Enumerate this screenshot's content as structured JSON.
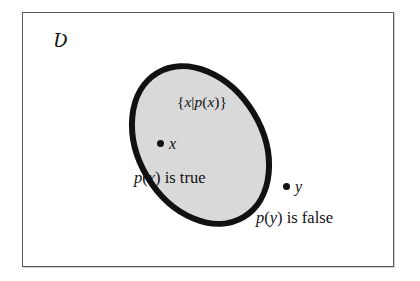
{
  "figure": {
    "type": "set-diagram"
  },
  "universe": {
    "symbol": "Ʋ",
    "name": "universal-set",
    "frame_color": "#59595c",
    "background_color": "#ffffff"
  },
  "set": {
    "name": "truth-set",
    "label": "{x|p(x)}",
    "label_parts": {
      "open_brace": "{",
      "var_x": "x",
      "bar": "|",
      "pred_p": "p",
      "open_paren": "(",
      "arg_x": "x",
      "close_paren": ")",
      "close_brace": "}"
    },
    "fill_color": "#d8d8d8",
    "stroke_color": "#111111",
    "stroke_width": 6,
    "rotation_deg": -31
  },
  "points": [
    {
      "name": "point-x",
      "label": "x",
      "inside_set": true,
      "caption": "p (x) is true",
      "caption_parts": {
        "pred": "p",
        "open_paren": "(",
        "arg": "x",
        "close_paren": ")",
        "verb": " is true"
      },
      "marker_color": "#121212"
    },
    {
      "name": "point-y",
      "label": "y",
      "inside_set": false,
      "caption": "p (y) is false",
      "caption_parts": {
        "pred": "p",
        "open_paren": "(",
        "arg": "y",
        "close_paren": ")",
        "verb": " is false"
      },
      "marker_color": "#121212"
    }
  ]
}
